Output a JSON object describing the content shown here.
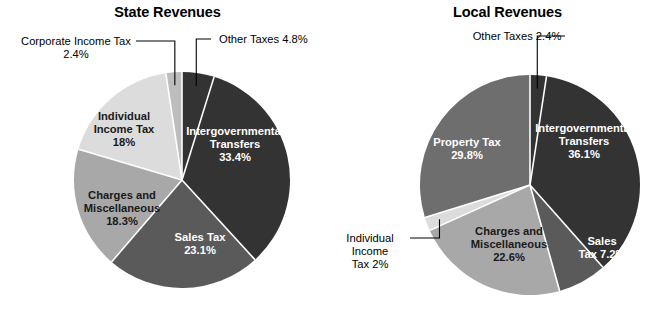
{
  "charts": [
    {
      "id": "state",
      "title": "State Revenues",
      "center": {
        "x": 182,
        "y": 180
      },
      "radius": 108,
      "slices": [
        {
          "name": "Intergovernmental Transfers",
          "label_lines": [
            "Intergovernmental",
            "Transfers",
            "33.4%"
          ],
          "value": 33.4,
          "percent_text": "33.4%",
          "color": "#333333",
          "label_style": "on-dark",
          "label_pos": {
            "x": 235,
            "y": 148
          },
          "callout": false
        },
        {
          "name": "Sales Tax",
          "label_lines": [
            "Sales Tax",
            "23.1%"
          ],
          "value": 23.1,
          "percent_text": "23.1%",
          "color": "#5a5a5a",
          "label_style": "on-dark",
          "label_pos": {
            "x": 200,
            "y": 247
          },
          "callout": false
        },
        {
          "name": "Charges and Miscellaneous",
          "label_lines": [
            "Charges and",
            "Miscellaneous",
            "18.3%"
          ],
          "value": 18.3,
          "percent_text": "18.3%",
          "color": "#a8a8a8",
          "label_style": "on-light",
          "label_pos": {
            "x": 122,
            "y": 212
          },
          "callout": false
        },
        {
          "name": "Individual Income Tax",
          "label_lines": [
            "Individual",
            "Income Tax",
            "18%"
          ],
          "value": 18.0,
          "percent_text": "18%",
          "color": "#dcdcdc",
          "label_style": "on-light",
          "label_pos": {
            "x": 124,
            "y": 133
          },
          "callout": false
        },
        {
          "name": "Corporate Income Tax",
          "label_lines": [
            "Corporate Income Tax",
            "2.4%"
          ],
          "value": 2.4,
          "percent_text": "2.4%",
          "color": "#bdbdbd",
          "label_style": "on-light",
          "callout": true,
          "callout_text_pos": {
            "x": 76,
            "y": 45
          },
          "callout_align": "middle"
        },
        {
          "name": "Other Taxes",
          "label_lines": [
            "Other Taxes 4.8%"
          ],
          "value": 4.8,
          "percent_text": "4.8%",
          "color": "#333333",
          "label_style": "on-dark",
          "callout": true,
          "callout_text_pos": {
            "x": 219,
            "y": 43
          },
          "callout_align": "start"
        }
      ]
    },
    {
      "id": "local",
      "title": "Local Revenues",
      "center": {
        "x": 198,
        "y": 185
      },
      "radius": 110,
      "slices": [
        {
          "name": "Intergovernmental Transfers",
          "label_lines": [
            "Intergovernmental",
            "Transfers",
            "36.1%"
          ],
          "value": 36.1,
          "percent_text": "36.1%",
          "color": "#333333",
          "label_style": "on-dark",
          "label_pos": {
            "x": 252,
            "y": 145
          },
          "callout": false
        },
        {
          "name": "Sales Tax",
          "label_lines": [
            "Sales",
            "Tax 7.2%"
          ],
          "value": 7.2,
          "percent_text": "7.2%",
          "color": "#5a5a5a",
          "label_style": "on-dark",
          "label_pos": {
            "x": 270,
            "y": 251
          },
          "callout": false
        },
        {
          "name": "Charges and Miscellaneous",
          "label_lines": [
            "Charges and",
            "Miscellaneous",
            "22.6%"
          ],
          "value": 22.6,
          "percent_text": "22.6%",
          "color": "#a8a8a8",
          "label_style": "on-light",
          "label_pos": {
            "x": 177,
            "y": 248
          },
          "callout": false
        },
        {
          "name": "Individual Income Tax",
          "label_lines": [
            "Individual",
            "Income",
            "Tax 2%"
          ],
          "value": 2.0,
          "percent_text": "2%",
          "color": "#dcdcdc",
          "label_style": "on-light",
          "callout": true,
          "callout_text_pos": {
            "x": 38,
            "y": 242
          },
          "callout_align": "middle"
        },
        {
          "name": "Property Tax",
          "label_lines": [
            "Property Tax",
            "29.8%"
          ],
          "value": 29.8,
          "percent_text": "29.8%",
          "color": "#6e6e6e",
          "label_style": "on-dark",
          "label_pos": {
            "x": 135,
            "y": 152
          },
          "callout": false
        },
        {
          "name": "Other Taxes",
          "label_lines": [
            "Other Taxes 2.4%"
          ],
          "value": 2.4,
          "percent_text": "2.4%",
          "color": "#333333",
          "label_style": "on-dark",
          "callout": true,
          "callout_text_pos": {
            "x": 185,
            "y": 40
          },
          "callout_align": "middle"
        }
      ]
    }
  ],
  "chart_data": [
    {
      "type": "pie",
      "title": "State Revenues",
      "categories": [
        "Intergovernmental Transfers",
        "Sales Tax",
        "Charges and Miscellaneous",
        "Individual Income Tax",
        "Corporate Income Tax",
        "Other Taxes"
      ],
      "values": [
        33.4,
        23.1,
        18.3,
        18.0,
        2.4,
        4.8
      ],
      "unit": "percent",
      "colors": [
        "#333333",
        "#5a5a5a",
        "#a8a8a8",
        "#dcdcdc",
        "#bdbdbd",
        "#333333"
      ],
      "start_angle_deg": 0,
      "direction": "clockwise",
      "legend": "none",
      "labels_inside": [
        "Intergovernmental Transfers 33.4%",
        "Sales Tax 23.1%",
        "Charges and Miscellaneous 18.3%",
        "Individual Income Tax 18%"
      ],
      "labels_callout": [
        "Corporate Income Tax 2.4%",
        "Other Taxes 4.8%"
      ],
      "xlabel": "",
      "ylabel": ""
    },
    {
      "type": "pie",
      "title": "Local Revenues",
      "categories": [
        "Intergovernmental Transfers",
        "Sales Tax",
        "Charges and Miscellaneous",
        "Individual Income Tax",
        "Property Tax",
        "Other Taxes"
      ],
      "values": [
        36.1,
        7.2,
        22.6,
        2.0,
        29.8,
        2.4
      ],
      "unit": "percent",
      "colors": [
        "#333333",
        "#5a5a5a",
        "#a8a8a8",
        "#dcdcdc",
        "#6e6e6e",
        "#333333"
      ],
      "start_angle_deg": 0,
      "direction": "clockwise",
      "legend": "none",
      "labels_inside": [
        "Intergovernmental Transfers 36.1%",
        "Sales Tax 7.2%",
        "Charges and Miscellaneous 22.6%",
        "Property Tax 29.8%"
      ],
      "labels_callout": [
        "Individual Income Tax 2%",
        "Other Taxes 2.4%"
      ],
      "xlabel": "",
      "ylabel": ""
    }
  ]
}
